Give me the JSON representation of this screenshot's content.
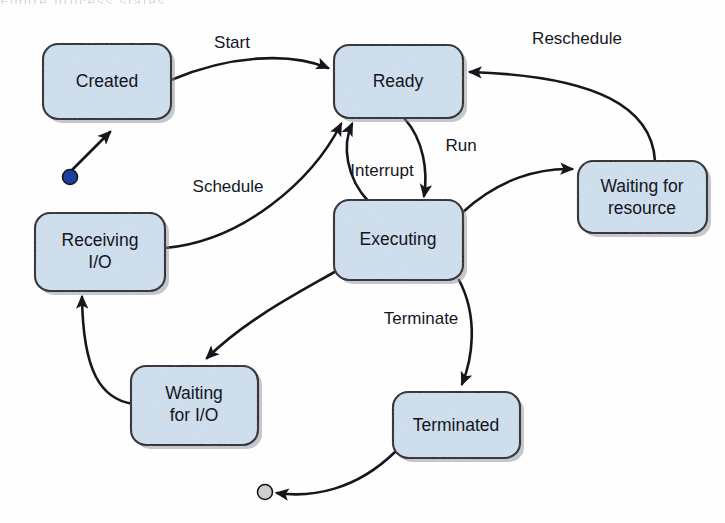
{
  "diagram": {
    "width": 725,
    "height": 523,
    "background_color": "#fefefe",
    "cropped_caption_artifact": "Figure  process states",
    "colors": {
      "box_fill": "#cfe0ef",
      "box_stroke": "#1b1b22",
      "box_shadow": "#8d9099",
      "edge_stroke": "#16161c",
      "label_text": "#14141c",
      "start_node_fill": "#1f3f9e",
      "end_node_fill": "#cfcfcf"
    },
    "nodes": [
      {
        "id": "created",
        "label": "Created",
        "x": 43,
        "y": 44,
        "w": 128,
        "h": 75,
        "lines": [
          "Created"
        ]
      },
      {
        "id": "ready",
        "label": "Ready",
        "x": 334,
        "y": 45,
        "w": 129,
        "h": 73,
        "lines": [
          "Ready"
        ]
      },
      {
        "id": "waiting-for-resource",
        "label": "Waiting for resource",
        "x": 578,
        "y": 161,
        "w": 129,
        "h": 72,
        "lines": [
          "Waiting for",
          "resource"
        ]
      },
      {
        "id": "receiving-io",
        "label": "Receiving I/O",
        "x": 35,
        "y": 213,
        "w": 130,
        "h": 78,
        "lines": [
          "Receiving",
          "I/O"
        ]
      },
      {
        "id": "executing",
        "label": "Executing",
        "x": 334,
        "y": 200,
        "w": 129,
        "h": 80,
        "lines": [
          "Executing"
        ]
      },
      {
        "id": "waiting-for-io",
        "label": "Waiting for I/O",
        "x": 131,
        "y": 366,
        "w": 127,
        "h": 79,
        "lines": [
          "Waiting",
          "for I/O"
        ]
      },
      {
        "id": "terminated",
        "label": "Terminated",
        "x": 393,
        "y": 392,
        "w": 127,
        "h": 66,
        "lines": [
          "Terminated"
        ]
      }
    ],
    "terminals": [
      {
        "id": "start-node",
        "kind": "initial",
        "cx": 70,
        "cy": 177,
        "r": 7.5,
        "fill": "#1f3f9e"
      },
      {
        "id": "end-node",
        "kind": "final",
        "cx": 265,
        "cy": 492,
        "r": 7.5,
        "fill": "#cfcfcf"
      }
    ],
    "transitions": [
      {
        "id": "start-to-created",
        "from": "start-node",
        "to": "created",
        "label": "",
        "path": "M 72 170 L 110 132"
      },
      {
        "id": "created-to-ready",
        "from": "created",
        "to": "ready",
        "label": "Start",
        "label_x": 232,
        "label_y": 44,
        "path": "M 171 80 C 230 55, 290 52, 328 68"
      },
      {
        "id": "ready-to-executing",
        "from": "ready",
        "to": "executing",
        "label": "Run",
        "label_x": 460,
        "label_y": 147,
        "path": "M 404 118 C 424 140, 428 172, 424 196"
      },
      {
        "id": "executing-to-ready",
        "from": "executing",
        "to": "ready",
        "label": "Interrupt",
        "label_x": 382,
        "label_y": 172,
        "path": "M 369 200 C 346 178, 342 145, 352 124"
      },
      {
        "id": "executing-to-waiting-for-resource",
        "from": "executing",
        "to": "waiting-for-resource",
        "label": "",
        "path": "M 463 210 C 500 178, 540 168, 572 169"
      },
      {
        "id": "waiting-for-resource-to-ready",
        "from": "waiting-for-resource",
        "to": "ready",
        "label": "Reschedule",
        "label_x": 577,
        "label_y": 40,
        "path": "M 655 161 C 652 110, 600 76, 470 72"
      },
      {
        "id": "executing-to-waiting-for-io",
        "from": "executing",
        "to": "waiting-for-io",
        "label": "",
        "path": "M 338 268 C 300 290, 250 320, 208 360"
      },
      {
        "id": "waiting-for-io-to-receiving-io",
        "from": "waiting-for-io",
        "to": "receiving-io",
        "label": "",
        "path": "M 131 404 C 100 400, 83 370, 82 298"
      },
      {
        "id": "receiving-io-to-ready",
        "from": "receiving-io",
        "to": "ready",
        "label": "Schedule",
        "label_x": 228,
        "label_y": 188,
        "path": "M 165 246 C 240 240, 310 180, 340 126"
      },
      {
        "id": "executing-to-terminated",
        "from": "executing",
        "to": "terminated",
        "label": "Terminate",
        "label_x": 421,
        "label_y": 320,
        "path": "M 459 280 C 478 320, 472 360, 462 386"
      },
      {
        "id": "terminated-to-end",
        "from": "terminated",
        "to": "end-node",
        "label": "",
        "path": "M 395 452 C 355 490, 310 497, 276 493"
      }
    ]
  }
}
